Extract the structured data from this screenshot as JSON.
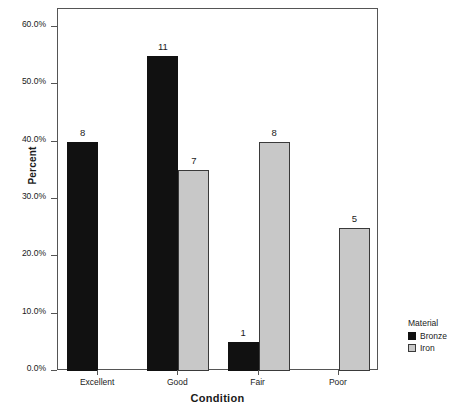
{
  "chart_data": {
    "type": "bar",
    "title": "",
    "xlabel": "Condition",
    "ylabel": "Percent",
    "categories": [
      "Excellent",
      "Good",
      "Fair",
      "Poor"
    ],
    "ylim": [
      0,
      60
    ],
    "ytick_labels": [
      "0.0%",
      "10.0%",
      "20.0%",
      "30.0%",
      "40.0%",
      "50.0%",
      "60.0%"
    ],
    "ytick_values": [
      0,
      10,
      20,
      30,
      40,
      50,
      60
    ],
    "grid": false,
    "legend_title": "Material",
    "legend_position": "right",
    "value_label_note": "Bar tops annotated with raw counts",
    "series": [
      {
        "name": "Bronze",
        "color": "#111111",
        "values": [
          40,
          55,
          5,
          null
        ],
        "counts": [
          "8",
          "11",
          "1",
          null
        ]
      },
      {
        "name": "Iron",
        "color": "#c8c8c8",
        "values": [
          null,
          35,
          40,
          25
        ],
        "counts": [
          null,
          "7",
          "8",
          "5"
        ]
      }
    ]
  },
  "axes": {
    "y_title": "Percent",
    "x_title": "Condition"
  },
  "legend": {
    "title": "Material",
    "items": [
      {
        "label": "Bronze",
        "color": "#111111"
      },
      {
        "label": "Iron",
        "color": "#c8c8c8"
      }
    ]
  }
}
